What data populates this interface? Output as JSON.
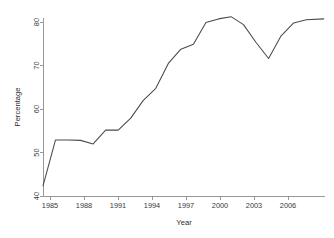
{
  "chart_data": {
    "type": "line",
    "title": "",
    "xlabel": "Year",
    "ylabel": "Percentage",
    "xlim": [
      1985,
      2007.5
    ],
    "ylim": [
      40,
      80
    ],
    "grid": false,
    "legend": null,
    "xticks": [
      1985,
      1988,
      1991,
      1994,
      1997,
      2000,
      2003,
      2006
    ],
    "xtick_labels": [
      "1985",
      "1988",
      "1991",
      "1994",
      "1997",
      "2000",
      "2003",
      "2006"
    ],
    "yticks": [
      40,
      50,
      60,
      70,
      80
    ],
    "ytick_labels": [
      "40",
      "50",
      "60",
      "70",
      "80"
    ],
    "line_color": "#4a4a4a",
    "x": [
      1985,
      1986,
      1987,
      1988,
      1989,
      1990,
      1991,
      1992,
      1993,
      1994,
      1995,
      1996,
      1997,
      1998,
      1999,
      2000,
      2001,
      2002,
      2003,
      2004,
      2005,
      2006,
      2007.4
    ],
    "values": [
      42.3,
      52.6,
      52.6,
      52.5,
      51.7,
      54.8,
      54.8,
      57.5,
      61.5,
      64.2,
      69.8,
      73.0,
      74.1,
      79.0,
      79.8,
      80.3,
      78.5,
      74.5,
      70.9,
      76.0,
      78.9,
      79.6,
      79.8
    ],
    "series": [
      {
        "name": "Percentage",
        "values": [
          42.3,
          52.6,
          52.6,
          52.5,
          51.7,
          54.8,
          54.8,
          57.5,
          61.5,
          64.2,
          69.8,
          73.0,
          74.1,
          79.0,
          79.8,
          80.3,
          78.5,
          74.5,
          70.9,
          76.0,
          78.9,
          79.6,
          79.8
        ]
      }
    ]
  }
}
